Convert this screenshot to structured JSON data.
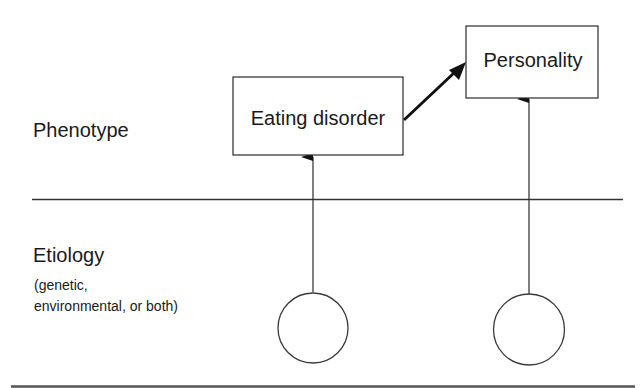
{
  "diagram": {
    "levels": {
      "phenotype": {
        "label": "Phenotype"
      },
      "etiology": {
        "label": "Etiology",
        "sublabel_line1": "(genetic,",
        "sublabel_line2": "environmental, or both)"
      }
    },
    "nodes": [
      {
        "id": "eating-disorder",
        "label": "Eating disorder",
        "level": "phenotype"
      },
      {
        "id": "personality",
        "label": "Personality",
        "level": "phenotype"
      }
    ],
    "causes": [
      {
        "id": "cause-left",
        "label": "",
        "level": "etiology",
        "points_to": "eating-disorder"
      },
      {
        "id": "cause-right",
        "label": "",
        "level": "etiology",
        "points_to": "personality"
      }
    ],
    "edges": [
      {
        "from": "eating-disorder",
        "to": "personality",
        "style": "bold-arrow"
      },
      {
        "from": "cause-left",
        "to": "eating-disorder",
        "style": "thin-arrow"
      },
      {
        "from": "cause-right",
        "to": "personality",
        "style": "thin-arrow"
      }
    ],
    "colors": {
      "stroke": "#2a2a2a",
      "text": "#1a1a1a",
      "background": "#ffffff"
    }
  }
}
